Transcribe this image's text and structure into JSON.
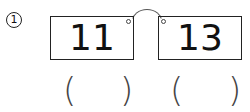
{
  "problem": {
    "marker": "①",
    "cards": [
      {
        "value": "11"
      },
      {
        "value": "13"
      }
    ],
    "answers": [
      {
        "open": "(",
        "close": ")",
        "value": ""
      },
      {
        "open": "(",
        "close": ")",
        "value": ""
      }
    ]
  }
}
